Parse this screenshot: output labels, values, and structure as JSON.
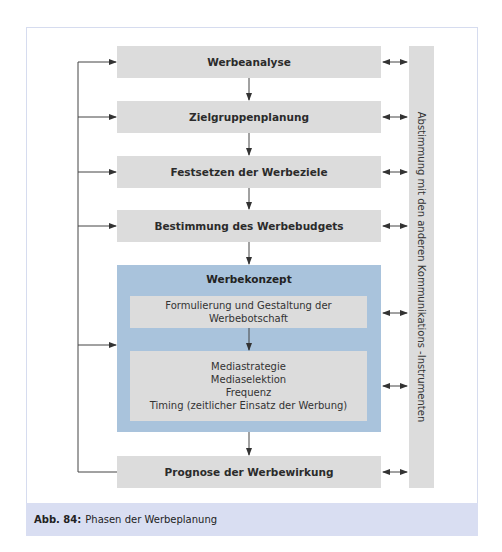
{
  "figure": {
    "steps": [
      {
        "label": "Werbeanalyse"
      },
      {
        "label": "Zielgruppenplanung"
      },
      {
        "label": "Festsetzen der Werbeziele"
      },
      {
        "label": "Bestimmung des Werbebudgets"
      }
    ],
    "concept": {
      "title": "Werbekonzept",
      "message_line1": "Formulierung und Gestaltung der",
      "message_line2": "Werbebotschaft",
      "media_lines": [
        "Mediastrategie",
        "Mediaselektion",
        "Frequenz",
        "Timing (zeitlicher Einsatz der Werbung)"
      ]
    },
    "final_step": {
      "label": "Prognose der Werbewirkung"
    },
    "side_label": "Abstimmung mit den anderen Kommunikations -Instrumenten",
    "caption": {
      "number": "Abb. 84:",
      "text": "Phasen der Werbeplanung"
    },
    "colors": {
      "box_gray": "#dcdcdc",
      "concept_blue": "#a9c3dc",
      "caption_band": "#d9def2",
      "frame_border": "#d6dcef"
    }
  }
}
